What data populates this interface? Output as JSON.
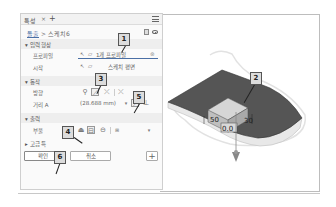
{
  "panel": {
    "tab_label": "특성",
    "tab_close": "×",
    "tab_add": "+",
    "breadcrumb": {
      "link": "돌출",
      "separator": ">",
      "current": "스케치6"
    },
    "sections": {
      "input_shape": "입력 형상",
      "behavior": "동작",
      "output": "출력",
      "advanced": "고급 특"
    },
    "rows": {
      "profile_label": "프로파일",
      "profile_value": "1개 프로파일",
      "start_label": "시작",
      "start_value": "스케치 평면",
      "direction_label": "방향",
      "distance_label": "거리 A",
      "distance_value": "(28.688 mm)",
      "boolean_label": "부울",
      "boolean_extra": "▾"
    },
    "buttons": {
      "ok": "확인",
      "cancel": "취소",
      "add": "+"
    }
  },
  "callouts": [
    "1",
    "2",
    "3",
    "4",
    "5",
    "6"
  ],
  "viewport": {
    "dimension_left": "50",
    "dimension_right": "30",
    "dimension_depth": "0.0"
  },
  "colors": {
    "top_face": "#555555",
    "side_face": "#e6e6e6",
    "link": "#4a6fa5",
    "callout_bg": "#dcdcdc"
  }
}
